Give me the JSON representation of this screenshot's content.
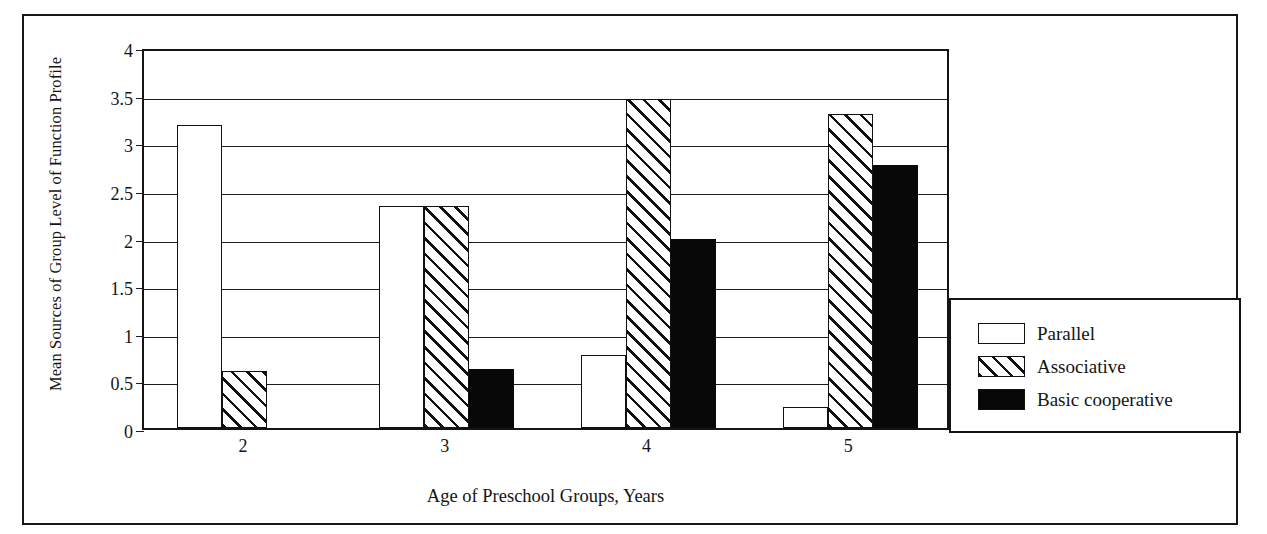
{
  "chart_data": {
    "type": "bar",
    "title": "",
    "xlabel": "Age of Preschool Groups, Years",
    "ylabel": "Mean Sources of Group Level of Function Profile",
    "categories": [
      "2",
      "3",
      "4",
      "5"
    ],
    "ylim": [
      0,
      4
    ],
    "yticks": [
      "0",
      "0.5",
      "1",
      "1.5",
      "2",
      "2.5",
      "3",
      "3.5",
      "4"
    ],
    "ytick_values": [
      0,
      0.5,
      1,
      1.5,
      2,
      2.5,
      3,
      3.5,
      4
    ],
    "grid": true,
    "legend_position": "right",
    "series": [
      {
        "name": "Parallel",
        "fill": "white",
        "values": [
          3.18,
          2.33,
          0.77,
          0.22
        ]
      },
      {
        "name": "Associative",
        "fill": "hatched",
        "values": [
          0.6,
          2.33,
          3.45,
          3.3
        ]
      },
      {
        "name": "Basic cooperative",
        "fill": "black",
        "values": [
          0.0,
          0.62,
          1.98,
          2.76
        ]
      }
    ]
  },
  "axes": {
    "y_title": "Mean Sources of Group Level of Function Profile",
    "x_title": "Age of Preschool Groups, Years"
  },
  "legend": {
    "items": [
      {
        "label": "Parallel"
      },
      {
        "label": "Associative"
      },
      {
        "label": "Basic cooperative"
      }
    ]
  },
  "colors": {
    "axis": "#141414",
    "gridline": "#1d1d1d",
    "bar_outline": "#111111",
    "bar_solid": "#080808",
    "background": "#ffffff"
  }
}
